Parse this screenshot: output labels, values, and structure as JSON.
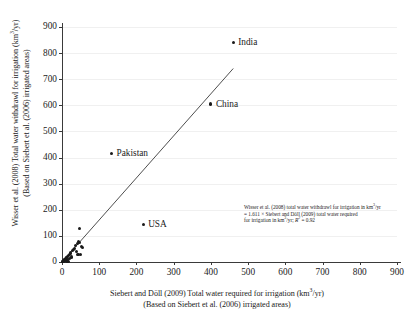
{
  "chart_data": {
    "type": "scatter",
    "title": "",
    "xlabel": "Siebert and Döll (2009) Total water required for irrigation (km3/yr)",
    "xlabel_line2": "(Based on Siebert et al. (2006) irrigated areas)",
    "ylabel": "Wisser et al. (2008) Total water withdrawl for irrigation (km3/yr)",
    "ylabel_line2": "(Based on Siebert et al. (2006) irrigated areas)",
    "xlim": [
      0,
      900
    ],
    "ylim": [
      0,
      900
    ],
    "xticks": [
      0,
      100,
      200,
      300,
      400,
      500,
      600,
      700,
      800,
      900
    ],
    "yticks": [
      0,
      100,
      200,
      300,
      400,
      500,
      600,
      700,
      800,
      900
    ],
    "grid": true,
    "legend": "none",
    "marker_color": "#1a1a1a",
    "line_color": "#3a3a3a",
    "points": [
      {
        "x": 460,
        "y": 840,
        "label": "India"
      },
      {
        "x": 400,
        "y": 605,
        "label": "China"
      },
      {
        "x": 133,
        "y": 415,
        "label": "Pakistan"
      },
      {
        "x": 218,
        "y": 143,
        "label": "USA"
      },
      {
        "x": 46,
        "y": 127,
        "label": ""
      },
      {
        "x": 44,
        "y": 80,
        "label": ""
      },
      {
        "x": 47,
        "y": 76,
        "label": ""
      },
      {
        "x": 41,
        "y": 70,
        "label": ""
      },
      {
        "x": 36,
        "y": 63,
        "label": ""
      },
      {
        "x": 52,
        "y": 58,
        "label": ""
      },
      {
        "x": 55,
        "y": 55,
        "label": ""
      },
      {
        "x": 33,
        "y": 52,
        "label": ""
      },
      {
        "x": 30,
        "y": 47,
        "label": ""
      },
      {
        "x": 27,
        "y": 44,
        "label": ""
      },
      {
        "x": 38,
        "y": 40,
        "label": ""
      },
      {
        "x": 24,
        "y": 38,
        "label": ""
      },
      {
        "x": 22,
        "y": 33,
        "label": ""
      },
      {
        "x": 43,
        "y": 30,
        "label": ""
      },
      {
        "x": 50,
        "y": 28,
        "label": ""
      },
      {
        "x": 19,
        "y": 27,
        "label": ""
      },
      {
        "x": 17,
        "y": 24,
        "label": ""
      },
      {
        "x": 15,
        "y": 21,
        "label": ""
      },
      {
        "x": 26,
        "y": 19,
        "label": ""
      },
      {
        "x": 13,
        "y": 18,
        "label": ""
      },
      {
        "x": 11,
        "y": 16,
        "label": ""
      },
      {
        "x": 20,
        "y": 14,
        "label": ""
      },
      {
        "x": 9,
        "y": 13,
        "label": ""
      },
      {
        "x": 8,
        "y": 11,
        "label": ""
      },
      {
        "x": 14,
        "y": 9,
        "label": ""
      },
      {
        "x": 7,
        "y": 8,
        "label": ""
      },
      {
        "x": 6,
        "y": 7,
        "label": ""
      },
      {
        "x": 10,
        "y": 6,
        "label": ""
      },
      {
        "x": 5,
        "y": 5,
        "label": ""
      },
      {
        "x": 4,
        "y": 4,
        "label": ""
      },
      {
        "x": 3,
        "y": 3,
        "label": ""
      },
      {
        "x": 2,
        "y": 2,
        "label": ""
      },
      {
        "x": 1,
        "y": 1,
        "label": ""
      },
      {
        "x": 16,
        "y": 3,
        "label": ""
      },
      {
        "x": 12,
        "y": 2,
        "label": ""
      }
    ],
    "trendline": {
      "x0": 0,
      "y0": 0,
      "x1": 460,
      "y1": 741,
      "slope": 1.611,
      "r2": 0.92
    }
  },
  "annotation": {
    "line1_a": "Wisser et al. (2008) total water withdrawl for irrigation in km",
    "line1_sup": "3",
    "line1_b": "/yr",
    "line2": "= 1.611 × Siebert and Döll (2009) total water required",
    "line3_a": "for irrigation in km",
    "line3_sup": "3",
    "line3_b": "/yr; ",
    "line3_r": "R",
    "line3_r_sup": "2",
    "line3_end": " = 0.92"
  },
  "axis_titles": {
    "y_line1_a": "Wisser et al. (2008) Total water withdrawl for irrigation (km",
    "y_line1_sup": "3",
    "y_line1_b": "/yr)",
    "y_line2": "(Based on Siebert et al. (2006) irrigated areas)",
    "x_line1_a": "Siebert and Döll (2009) Total water required for irrigation (km",
    "x_line1_sup": "3",
    "x_line1_b": "/yr)",
    "x_line2": "(Based on Siebert et al. (2006) irrigated areas)"
  }
}
